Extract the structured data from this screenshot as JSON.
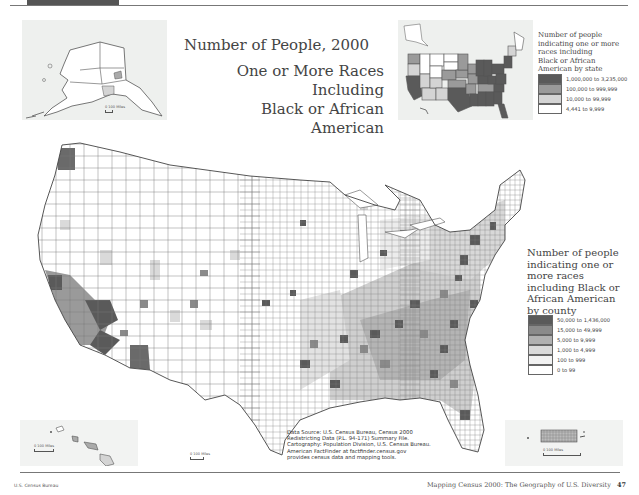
{
  "page": {
    "footer_left": "U.S. Census Bureau",
    "footer_right_text": "Mapping Census 2000: The Geography of U.S. Diversity",
    "page_number": "47"
  },
  "map": {
    "title": "Number of People, 2000",
    "subtitle_line1": "One or More Races Including",
    "subtitle_line2": "Black or African American",
    "source_lines": [
      "Data Source: U.S. Census Bureau, Census 2000",
      "Redistricting Data (P.L. 94-171) Summary File.",
      "Cartography: Population Division, U.S. Census Bureau.",
      "American FactFinder at factfinder.census.gov",
      "provides census data and mapping tools."
    ],
    "insets": {
      "alaska_scale": "0   100 Miles",
      "hawaii_scale": "0   100 Miles",
      "contiguous_scale": "0   100 Miles",
      "puerto_rico_scale": "0   100 Miles"
    }
  },
  "legend_state": {
    "title": "Number of people indicating one or more races including Black or African American by state",
    "title_lines": [
      "Number of people",
      "indicating one or more",
      "races including",
      "Black or African",
      "American by state"
    ],
    "classes": [
      {
        "label": "1,000,000 to 3,235,000",
        "color": "#5a5a5a"
      },
      {
        "label": "100,000 to 999,999",
        "color": "#9a9a9a"
      },
      {
        "label": "10,000 to 99,999",
        "color": "#d4d4d4"
      },
      {
        "label": "4,441 to 9,999",
        "color": "#ffffff"
      }
    ]
  },
  "legend_county": {
    "title_lines": [
      "Number of people",
      "indicating one or",
      "more races",
      "including Black or",
      "African American",
      "by county"
    ],
    "classes": [
      {
        "label": "50,000 to 1,436,000",
        "color": "#5a5a5a"
      },
      {
        "label": "15,000 to 49,999",
        "color": "#8a8a8a"
      },
      {
        "label": "5,000 to 9,999",
        "color": "#b0b0b0"
      },
      {
        "label": "1,000 to 4,999",
        "color": "#dadada"
      },
      {
        "label": "100 to 999",
        "color": "#f2f2f2"
      },
      {
        "label": "0 to 99",
        "color": "#ffffff"
      }
    ]
  }
}
